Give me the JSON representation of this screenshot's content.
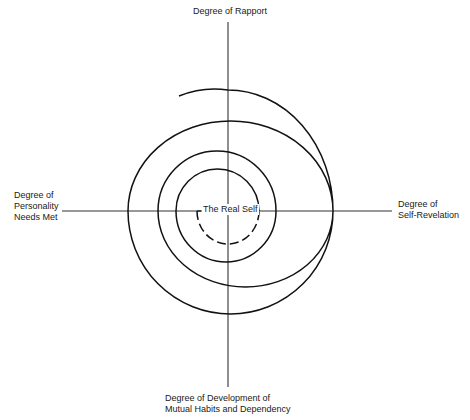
{
  "diagram": {
    "type": "spiral-axis-diagram",
    "axes": {
      "top": {
        "lines": [
          "Degree of Rapport"
        ]
      },
      "left": {
        "lines": [
          "Degree of",
          "Personality",
          "Needs Met"
        ]
      },
      "right": {
        "lines": [
          "Degree of",
          "Self-Revelation"
        ]
      },
      "bottom": {
        "lines": [
          "Degree of Development of",
          "Mutual Habits and Dependency"
        ]
      }
    },
    "center": {
      "label": "The Real Self"
    },
    "spiral": {
      "turns": 4,
      "inner_segment_style": "dashed",
      "stroke_color": "#111111"
    },
    "axis_color": "#333333"
  }
}
